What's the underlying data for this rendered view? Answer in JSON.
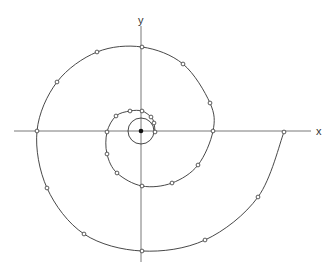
{
  "diagram": {
    "type": "archimedean-spiral-plot",
    "origin": {
      "x": 141,
      "y": 131
    },
    "axes": {
      "x_label": "x",
      "y_label": "y",
      "x_axis": {
        "x1": 14,
        "x2": 311,
        "y": 131
      },
      "y_axis": {
        "x": 141,
        "y1": 26,
        "y2": 262
      },
      "x_label_pos": {
        "x": 316,
        "y": 135
      },
      "y_label_pos": {
        "x": 138,
        "y": 24
      }
    },
    "inner_circle": {
      "cx": 141,
      "cy": 131,
      "r": 13
    },
    "spiral_points": [
      [
        284,
        132
      ],
      [
        258,
        197
      ],
      [
        205,
        240
      ],
      [
        142,
        251
      ],
      [
        84,
        234
      ],
      [
        47,
        188
      ],
      [
        37,
        131
      ],
      [
        57,
        82
      ],
      [
        97,
        52
      ],
      [
        142,
        47
      ],
      [
        183,
        64
      ],
      [
        210,
        103
      ],
      [
        213,
        131
      ],
      [
        198,
        165
      ],
      [
        172,
        183
      ],
      [
        142,
        186
      ],
      [
        117,
        173
      ],
      [
        107,
        154
      ],
      [
        107,
        132
      ],
      [
        116,
        116
      ],
      [
        130,
        111
      ],
      [
        142,
        111
      ],
      [
        151,
        117
      ],
      [
        154,
        123
      ],
      [
        155,
        132
      ]
    ],
    "colors": {
      "line": "#333333",
      "axis": "#555555",
      "marker_fill": "#ffffff",
      "origin_dot": "#111111",
      "background": "#ffffff"
    }
  }
}
